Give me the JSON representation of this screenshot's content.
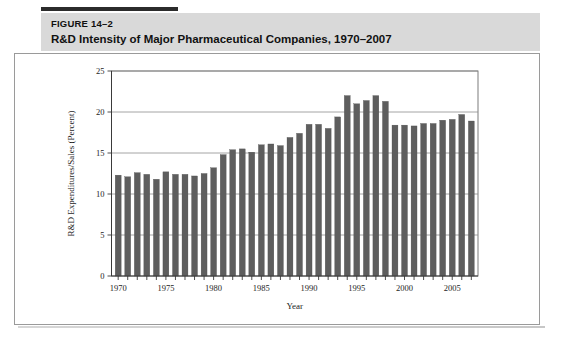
{
  "figure": {
    "number": "FIGURE 14–2",
    "title": "R&D Intensity of Major Pharmaceutical Companies, 1970–2007"
  },
  "colors": {
    "bar": "#5e5e5e",
    "header_band": "#d9d9d9",
    "top_rule": "#2b2b2b",
    "grid": "#8d8d8d",
    "axis": "#3a3a3a",
    "frame": "#6d6d6d"
  },
  "chart_data": {
    "type": "bar",
    "title": "R&D Intensity of Major Pharmaceutical Companies, 1970–2007",
    "xlabel": "Year",
    "ylabel": "R&D Expenditures/Sales (Percent)",
    "ylim": [
      0,
      25
    ],
    "ytick_values": [
      0,
      5,
      10,
      15,
      20,
      25
    ],
    "ytick_labels": [
      "0",
      "5",
      "10",
      "15",
      "20",
      "25"
    ],
    "xlim": [
      1969.3,
      2007.7
    ],
    "xtick_labels": [
      "1970",
      "1975",
      "1980",
      "1985",
      "1990",
      "1995",
      "2000",
      "2005"
    ],
    "xtick_values": [
      1970,
      1975,
      1980,
      1985,
      1990,
      1995,
      2000,
      2005
    ],
    "minor_xticks_every": 1,
    "grid": "horizontal",
    "legend": "none",
    "categories": [
      1970,
      1971,
      1972,
      1973,
      1974,
      1975,
      1976,
      1977,
      1978,
      1979,
      1980,
      1981,
      1982,
      1983,
      1984,
      1985,
      1986,
      1987,
      1988,
      1989,
      1990,
      1991,
      1992,
      1993,
      1994,
      1995,
      1996,
      1997,
      1998,
      1999,
      2000,
      2001,
      2002,
      2003,
      2004,
      2005,
      2006,
      2007
    ],
    "values": [
      12.3,
      12.1,
      12.6,
      12.4,
      11.8,
      12.7,
      12.4,
      12.4,
      12.2,
      12.5,
      13.2,
      14.8,
      15.4,
      15.5,
      15.1,
      16.0,
      16.1,
      15.9,
      16.9,
      17.4,
      18.5,
      18.5,
      18.0,
      19.4,
      22.0,
      21.0,
      21.4,
      22.0,
      21.3,
      18.4,
      18.4,
      18.3,
      18.6,
      18.6,
      19.0,
      19.1,
      19.7,
      18.9
    ],
    "units": "percent"
  }
}
